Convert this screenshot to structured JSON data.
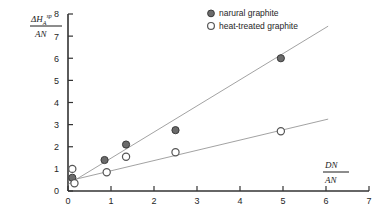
{
  "chart_data": {
    "type": "scatter",
    "title": "",
    "xlabel": "DN / AN",
    "ylabel": "ΔH_A^sp / AN",
    "xlabel_numerator": "DN",
    "xlabel_denominator": "AN",
    "ylabel_numerator": "ΔH",
    "ylabel_numerator_sub": "A",
    "ylabel_numerator_sup": "sp",
    "ylabel_denominator": "AN",
    "xlim": [
      0,
      7
    ],
    "ylim": [
      0,
      8
    ],
    "xticks": [
      0,
      1,
      2,
      3,
      4,
      5,
      6,
      7
    ],
    "yticks": [
      0,
      1,
      2,
      3,
      4,
      5,
      6,
      7,
      8
    ],
    "xtick_labels": [
      "0",
      "1",
      "2",
      "3",
      "4",
      "5",
      "6",
      "7"
    ],
    "ytick_labels": [
      "0",
      "1",
      "2",
      "3",
      "4",
      "5",
      "6",
      "7",
      "8"
    ],
    "grid": false,
    "legend_position": "top-right",
    "series": [
      {
        "name": "narural graphite",
        "marker": "filled-circle",
        "marker_color": "#6b6b6b",
        "marker_edge_color": "#3a3a3a",
        "points": [
          {
            "x": 0.1,
            "y": 0.6
          },
          {
            "x": 0.85,
            "y": 1.4
          },
          {
            "x": 1.35,
            "y": 2.1
          },
          {
            "x": 2.5,
            "y": 2.75
          },
          {
            "x": 4.95,
            "y": 6.0
          }
        ],
        "fit_line": {
          "x0": 0.0,
          "y0": 0.3,
          "x1": 6.05,
          "y1": 7.45
        }
      },
      {
        "name": "heat-treated graphite",
        "marker": "open-circle",
        "marker_color": "#ffffff",
        "marker_edge_color": "#555555",
        "points": [
          {
            "x": 0.1,
            "y": 1.0
          },
          {
            "x": 0.15,
            "y": 0.35
          },
          {
            "x": 0.9,
            "y": 0.85
          },
          {
            "x": 1.35,
            "y": 1.55
          },
          {
            "x": 2.5,
            "y": 1.75
          },
          {
            "x": 4.95,
            "y": 2.7
          }
        ],
        "fit_line": {
          "x0": 0.0,
          "y0": 0.45,
          "x1": 6.05,
          "y1": 3.25
        }
      }
    ]
  },
  "legend": {
    "entries": [
      {
        "label": "narural graphite",
        "marker": "filled-circle"
      },
      {
        "label": "heat-treated graphite",
        "marker": "open-circle"
      }
    ]
  },
  "colors": {
    "axis": "#333333",
    "text": "#262626",
    "marker_filled": "#6b6b6b",
    "marker_open_edge": "#555555",
    "fit_line": "#8a8a8a",
    "background": "#ffffff"
  }
}
